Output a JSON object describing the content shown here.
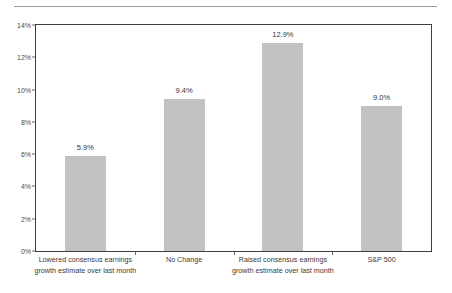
{
  "chart_data": {
    "type": "bar",
    "title": "",
    "subtitle": "",
    "xlabel": "",
    "ylabel": "",
    "ylim": [
      0,
      14
    ],
    "ytick_labels": [
      "0%",
      "2%",
      "4%",
      "6%",
      "8%",
      "10%",
      "12%",
      "14%"
    ],
    "ytick_values": [
      0,
      2,
      4,
      6,
      8,
      10,
      12,
      14
    ],
    "grid": false,
    "legend": null,
    "bar_color": "#c2c2c2",
    "categories": [
      "Lowered consensus earnings growth estimate over last month",
      "No Change",
      "Raised consensus earnings growth estimate over last month",
      "S&P 500"
    ],
    "category_lines": [
      [
        "Lowered consensus earnings",
        "growth estimate over last month"
      ],
      [
        "No Change",
        ""
      ],
      [
        "Raised consensus earnings",
        "growth estimate over last month"
      ],
      [
        "S&P 500",
        ""
      ]
    ],
    "values": [
      5.9,
      9.4,
      12.9,
      9.0
    ],
    "value_labels": [
      "5.9%",
      "9.4%",
      "12.9%",
      "9.0%"
    ]
  }
}
